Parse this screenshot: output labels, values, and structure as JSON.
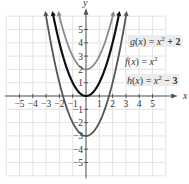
{
  "chart_data": {
    "type": "line",
    "title": "",
    "xlabel": "x",
    "ylabel": "y",
    "xlim": [
      -5.5,
      5.5
    ],
    "ylim": [
      -5.5,
      5.5
    ],
    "grid": true,
    "x_ticks": [
      -5,
      -4,
      -3,
      -2,
      -1,
      1,
      2,
      3,
      4,
      5
    ],
    "y_ticks": [
      -5,
      -4,
      -3,
      -2,
      -1,
      1,
      2,
      3,
      4,
      5
    ],
    "series": [
      {
        "name": "g(x) = x² + 2",
        "function": "x^2+2",
        "shift": 2,
        "color": "#8a8a8a",
        "x": [
          -1.87,
          -1,
          0,
          1,
          1.87
        ],
        "y": [
          5.5,
          3,
          2,
          3,
          5.5
        ]
      },
      {
        "name": "f(x) = x²",
        "function": "x^2",
        "shift": 0,
        "color": "#111111",
        "x": [
          -2.35,
          -2,
          -1,
          0,
          1,
          2,
          2.35
        ],
        "y": [
          5.5,
          4,
          1,
          0,
          1,
          4,
          5.5
        ]
      },
      {
        "name": "h(x) = x² − 3",
        "function": "x^2-3",
        "shift": -3,
        "color": "#555555",
        "x": [
          -2.92,
          -2,
          -1,
          0,
          1,
          2,
          2.92
        ],
        "y": [
          5.5,
          1,
          -2,
          -3,
          -2,
          1,
          5.5
        ]
      }
    ],
    "legend": [
      {
        "text": "g(x) = x² + 2",
        "position": "upper-right"
      },
      {
        "text": "f(x) = x²",
        "position": "right"
      },
      {
        "text": "h(x) = x² − 3",
        "position": "right"
      }
    ]
  },
  "labels": {
    "g": {
      "fn": "g",
      "arg": "x",
      "rhs_var": "x",
      "rhs": " + 2"
    },
    "f": {
      "fn": "f",
      "arg": "x",
      "rhs_var": "x",
      "rhs": ""
    },
    "h": {
      "fn": "h",
      "arg": "x",
      "rhs_var": "x",
      "rhs": " − 3"
    }
  }
}
